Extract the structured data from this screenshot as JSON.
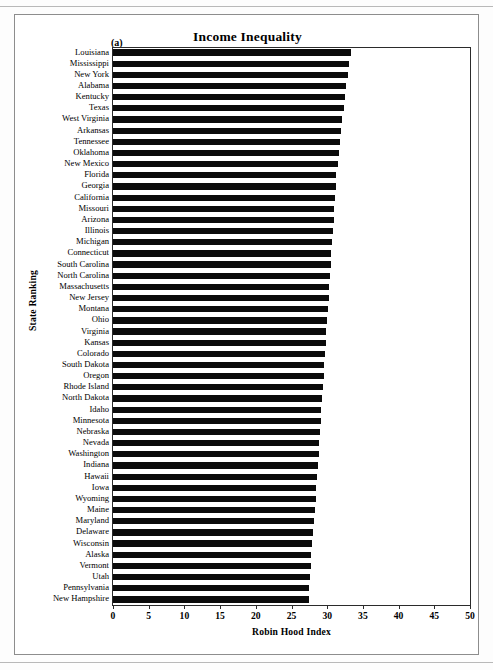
{
  "figure": {
    "panel_label": "(a)",
    "title": "Income Inequality"
  },
  "chart_data": {
    "type": "bar",
    "orientation": "horizontal",
    "title": "Income Inequality",
    "xlabel": "Robin Hood Index",
    "ylabel": "State Ranking",
    "xlim": [
      0,
      50
    ],
    "xticks": [
      0,
      5,
      10,
      15,
      20,
      25,
      30,
      35,
      40,
      45,
      50
    ],
    "grid": false,
    "legend": null,
    "bar_color": "#0b0b0b",
    "categories": [
      "Louisiana",
      "Mississippi",
      "New York",
      "Alabama",
      "Kentucky",
      "Texas",
      "West Virginia",
      "Arkansas",
      "Tennessee",
      "Oklahoma",
      "New Mexico",
      "Florida",
      "Georgia",
      "California",
      "Missouri",
      "Arizona",
      "Illinois",
      "Michigan",
      "Connecticut",
      "South Carolina",
      "North Carolina",
      "Massachusetts",
      "New Jersey",
      "Montana",
      "Ohio",
      "Virginia",
      "Kansas",
      "Colorado",
      "South Dakota",
      "Oregon",
      "Rhode Island",
      "North Dakota",
      "Idaho",
      "Minnesota",
      "Nebraska",
      "Nevada",
      "Washington",
      "Indiana",
      "Hawaii",
      "Iowa",
      "Wyoming",
      "Maine",
      "Maryland",
      "Delaware",
      "Wisconsin",
      "Alaska",
      "Vermont",
      "Utah",
      "Pennsylvania",
      "New Hampshire"
    ],
    "values": [
      33.4,
      33.1,
      32.9,
      32.7,
      32.5,
      32.3,
      32.1,
      31.9,
      31.8,
      31.7,
      31.5,
      31.3,
      31.2,
      31.1,
      31.0,
      30.9,
      30.8,
      30.7,
      30.6,
      30.5,
      30.4,
      30.3,
      30.2,
      30.1,
      30.0,
      29.9,
      29.8,
      29.7,
      29.6,
      29.5,
      29.4,
      29.3,
      29.2,
      29.1,
      29.0,
      28.9,
      28.8,
      28.7,
      28.6,
      28.5,
      28.4,
      28.3,
      28.2,
      28.0,
      27.9,
      27.8,
      27.7,
      27.6,
      27.5,
      27.4
    ]
  }
}
